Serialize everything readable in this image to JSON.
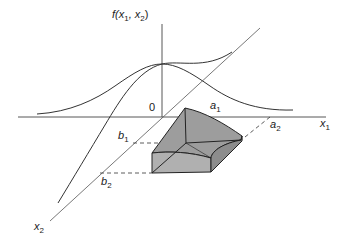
{
  "figure": {
    "colors": {
      "line": "#333333",
      "axis": "#555555",
      "solid_fill": "#a6a6a6",
      "solid_edge": "#222222",
      "background": "#ffffff"
    },
    "labels": {
      "f_axis": {
        "base": "f(x",
        "sub1": "1",
        "mid": ", x",
        "sub2": "2",
        "end": ")"
      },
      "origin": "0",
      "x1_axis": {
        "base": "x",
        "sub": "1"
      },
      "x2_axis": {
        "base": "x",
        "sub": "2"
      },
      "a1": {
        "base": "a",
        "sub": "1"
      },
      "a2": {
        "base": "a",
        "sub": "2"
      },
      "b1": {
        "base": "b",
        "sub": "1"
      },
      "b2": {
        "base": "b",
        "sub": "2"
      }
    }
  }
}
